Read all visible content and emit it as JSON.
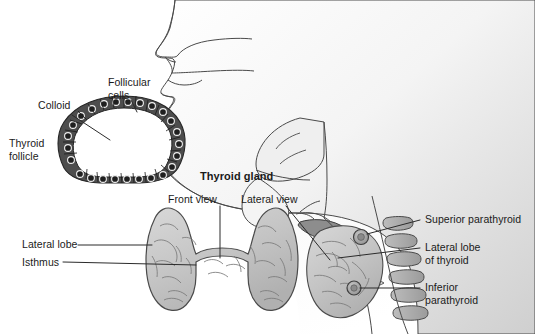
{
  "figure": {
    "background_color": "#ffffff",
    "width": 535,
    "height": 334
  },
  "colors": {
    "outline": "#3c3c3c",
    "text": "#1a1a1a",
    "head_fill_light": "#fbfbfb",
    "head_fill_dark": "#d2d2d2",
    "gland_fill": "#c9c9c9",
    "gland_shade": "#9a9a9a",
    "gland_outline": "#4a4a4a",
    "cartilage_fill": "#8d8d8d",
    "vertebra_fill": "#a8a8a8",
    "follicle_cell_fill": "#4d4d4d",
    "follicle_nucleus": "#2a2a2a",
    "colloid_fill": "#ffffff",
    "leader_line": "#2b2b2b"
  },
  "labels": {
    "follicular_cells": "Follicular\ncells",
    "colloid": "Colloid",
    "thyroid_follicle": "Thyroid\nfollicle",
    "thyroid_gland": "Thyroid gland",
    "front_view": "Front view",
    "lateral_view": "Lateral view",
    "lateral_lobe": "Lateral lobe",
    "isthmus": "Isthmus",
    "superior_parathyroid": "Superior parathyroid",
    "lateral_lobe_of_thyroid": "Lateral lobe\nof thyroid",
    "inferior_parathyroid": "Inferior\nparathyroid"
  },
  "panels": [
    {
      "name": "thyroid-follicle-micrograph",
      "caption": "Thyroid follicle cross-section",
      "parts": [
        "Follicular cells",
        "Colloid",
        "Thyroid follicle"
      ]
    },
    {
      "name": "thyroid-gland-front-view",
      "caption": "Front view",
      "parts": [
        "Lateral lobe",
        "Isthmus"
      ]
    },
    {
      "name": "thyroid-gland-lateral-view",
      "caption": "Lateral view",
      "parts": [
        "Superior parathyroid",
        "Lateral lobe of thyroid",
        "Inferior parathyroid"
      ]
    },
    {
      "name": "head-neck-sagittal-profile",
      "caption": "Mid-sagittal head and neck profile",
      "parts": [
        "nasal cavity",
        "tongue",
        "pharynx",
        "larynx",
        "trachea",
        "cervical vertebrae"
      ]
    }
  ]
}
